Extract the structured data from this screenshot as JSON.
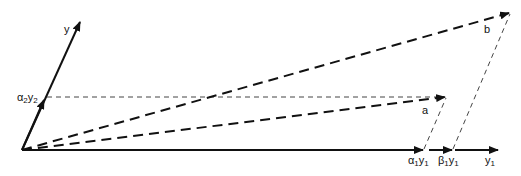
{
  "diagram": {
    "type": "vector-decomposition",
    "colors": {
      "line": "#111111",
      "thin_dash": "#444444",
      "background": "#ffffff"
    },
    "labels": {
      "y_axis": "y",
      "alpha2y2": {
        "greek": "α",
        "sub1": "2",
        "var": "y",
        "sub2": "2"
      },
      "vector_a": "a",
      "vector_b": "b",
      "alpha1y1": {
        "greek": "α",
        "sub1": "1",
        "var": "y",
        "sub2": "1"
      },
      "beta1y1": {
        "greek": "β",
        "sub1": "1",
        "var": "y",
        "sub2": "1"
      },
      "y1": {
        "var": "y",
        "sub": "1"
      }
    }
  }
}
